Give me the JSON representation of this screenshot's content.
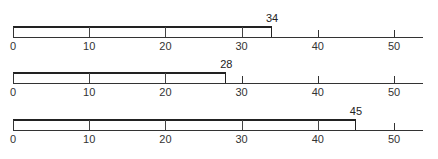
{
  "chart_data": [
    {
      "type": "bar",
      "orientation": "horizontal",
      "categories": [
        ""
      ],
      "values": [
        34
      ],
      "data_labels": [
        "34"
      ],
      "title": "",
      "xlabel": "",
      "ylabel": "",
      "xlim": [
        0,
        55
      ],
      "ticks": [
        0,
        10,
        20,
        30,
        40,
        50
      ],
      "tick_labels": [
        "0",
        "10",
        "20",
        "30",
        "40",
        "50"
      ],
      "grid": false,
      "legend": null
    },
    {
      "type": "bar",
      "orientation": "horizontal",
      "categories": [
        ""
      ],
      "values": [
        28
      ],
      "data_labels": [
        "28"
      ],
      "title": "",
      "xlabel": "",
      "ylabel": "",
      "xlim": [
        0,
        55
      ],
      "ticks": [
        0,
        10,
        20,
        30,
        40,
        50
      ],
      "tick_labels": [
        "0",
        "10",
        "20",
        "30",
        "40",
        "50"
      ],
      "grid": false,
      "legend": null
    },
    {
      "type": "bar",
      "orientation": "horizontal",
      "categories": [
        ""
      ],
      "values": [
        45
      ],
      "data_labels": [
        "45"
      ],
      "title": "",
      "xlabel": "",
      "ylabel": "",
      "xlim": [
        0,
        55
      ],
      "ticks": [
        0,
        10,
        20,
        30,
        40,
        50
      ],
      "tick_labels": [
        "0",
        "10",
        "20",
        "30",
        "40",
        "50"
      ],
      "grid": false,
      "legend": null
    }
  ],
  "charts": [
    {
      "value": 34,
      "label": "34"
    },
    {
      "value": 28,
      "label": "28"
    },
    {
      "value": 45,
      "label": "45"
    }
  ],
  "ticks": [
    "0",
    "10",
    "20",
    "30",
    "40",
    "50"
  ]
}
